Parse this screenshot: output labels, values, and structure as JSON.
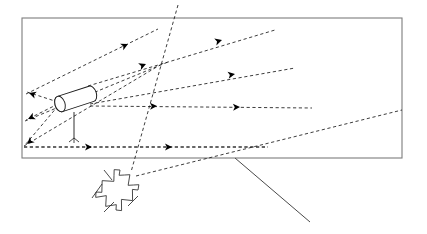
{
  "figure": {
    "type": "schematic-diagram",
    "caption": "",
    "background_color": "#ffffff",
    "line_color": "#1a1a1a",
    "boundary_color": "#7d7d7d",
    "arrow_color": "#000000"
  },
  "canvas": {
    "width": 427,
    "height": 234
  },
  "boundary": {
    "label": "",
    "shape": "rectangle",
    "x": 22,
    "y": 18,
    "width": 380,
    "height": 140,
    "stroke": "#7d7d7d"
  },
  "source": {
    "label": "",
    "kind": "cylindrical-emitter-on-mast",
    "cylinder": {
      "cap_center_x": 60,
      "cap_center_y": 104,
      "cap_rx": 5.0,
      "cap_ry": 8.0,
      "length": 33,
      "tilt_deg": -18
    },
    "mast": {
      "x": 74,
      "y_top": 112,
      "y_bottom": 138
    },
    "feet": 3
  },
  "scatterer": {
    "label": "",
    "kind": "zigzag-scatterer",
    "center_x": 118,
    "center_y": 188,
    "zigzag_count": 4,
    "tail_count": 4
  },
  "pointer_line": {
    "label": "",
    "x1": 235,
    "y1": 158,
    "x2": 310,
    "y2": 222
  },
  "rays": [
    {
      "name": "ray-upper-left-1",
      "x1": 58,
      "y1": 102,
      "x2": 27,
      "y2": 92,
      "arrow_t": 0.92,
      "direction": "left"
    },
    {
      "name": "ray-upper-left-2",
      "x1": 58,
      "y1": 104,
      "x2": 26,
      "y2": 120,
      "arrow_t": 0.92,
      "direction": "left"
    },
    {
      "name": "ray-upper-left-3",
      "x1": 58,
      "y1": 106,
      "x2": 25,
      "y2": 145,
      "arrow_t": 0.92,
      "direction": "left"
    },
    {
      "name": "ray-long-up-1",
      "x1": 26,
      "y1": 94,
      "x2": 158,
      "y2": 29,
      "arrow_t": 0.62,
      "direction": "right"
    },
    {
      "name": "ray-long-up-2",
      "x1": 25,
      "y1": 121,
      "x2": 168,
      "y2": 62,
      "arrow_t": 0.56,
      "direction": "right"
    },
    {
      "name": "ray-long-up-3",
      "x1": 24,
      "y1": 146,
      "x2": 160,
      "y2": 65,
      "arrow_t": 0.55,
      "direction": "right"
    },
    {
      "name": "ray-right-upper",
      "x1": 88,
      "y1": 86,
      "x2": 275,
      "y2": 30,
      "arrow_t": 0.52,
      "direction": "right"
    },
    {
      "name": "ray-right-mid",
      "x1": 90,
      "y1": 104,
      "x2": 295,
      "y2": 68,
      "arrow_t": 0.54,
      "direction": "right"
    },
    {
      "name": "ray-right-low",
      "x1": 90,
      "y1": 106,
      "x2": 312,
      "y2": 108,
      "arrow_t": 0.5,
      "direction": "right"
    },
    {
      "name": "ray-horizontal-base",
      "x1": 24,
      "y1": 147,
      "x2": 268,
      "y2": 147,
      "arrow_t": 0.38,
      "direction": "right"
    },
    {
      "name": "ray-horizontal-base-2",
      "x1": 24,
      "y1": 147,
      "x2": 268,
      "y2": 147,
      "arrow_t": 0.7,
      "direction": "right"
    },
    {
      "name": "ray-steep-descend",
      "x1": 178,
      "y1": 5,
      "x2": 131,
      "y2": 172,
      "arrow_t": null,
      "direction": "none"
    },
    {
      "name": "ray-scatter-to-right",
      "x1": 136,
      "y1": 176,
      "x2": 402,
      "y2": 110,
      "arrow_t": null,
      "direction": "none"
    }
  ],
  "arrow_marks": [
    {
      "name": "arrow-upper-fan-1",
      "x": 128,
      "y": 44,
      "angle_deg": -26
    },
    {
      "name": "arrow-upper-fan-2",
      "x": 146,
      "y": 64,
      "angle_deg": -22
    },
    {
      "name": "arrow-upper-fan-3",
      "x": 222,
      "y": 40,
      "angle_deg": -17
    },
    {
      "name": "arrow-right-mid",
      "x": 235,
      "y": 74,
      "angle_deg": -10
    },
    {
      "name": "arrow-right-low",
      "x": 157,
      "y": 106,
      "angle_deg": -2
    },
    {
      "name": "arrow-right-low-2",
      "x": 240,
      "y": 107,
      "angle_deg": -2
    },
    {
      "name": "arrow-base-1",
      "x": 92,
      "y": 147,
      "angle_deg": 0
    },
    {
      "name": "arrow-base-2",
      "x": 172,
      "y": 147,
      "angle_deg": 0
    },
    {
      "name": "arrow-left-1",
      "x": 29,
      "y": 93,
      "angle_deg": 198
    },
    {
      "name": "arrow-left-2",
      "x": 28,
      "y": 119,
      "angle_deg": 155
    },
    {
      "name": "arrow-left-3",
      "x": 27,
      "y": 144,
      "angle_deg": 140
    }
  ]
}
